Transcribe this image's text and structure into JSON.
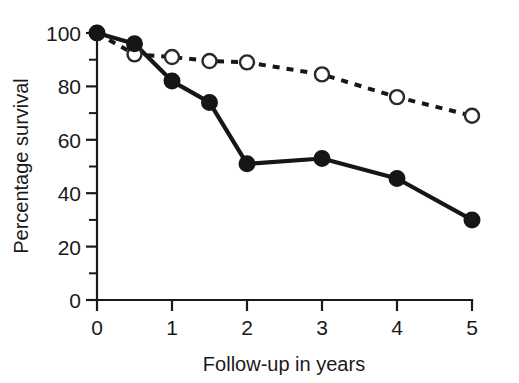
{
  "chart_data": {
    "type": "line",
    "title": "",
    "xlabel": "Follow-up in years",
    "ylabel": "Percentage survival",
    "xlim": [
      0,
      5
    ],
    "ylim": [
      0,
      100
    ],
    "xticks": [
      0,
      1,
      2,
      3,
      4,
      5
    ],
    "xtick_labels": [
      "0",
      "1",
      "2",
      "3",
      "4",
      "5"
    ],
    "yticks": [
      0,
      20,
      40,
      60,
      80,
      100
    ],
    "ytick_labels": [
      "0",
      "20",
      "40",
      "60",
      "80",
      "100"
    ],
    "yticks_minor": [
      10,
      30,
      50,
      70,
      90
    ],
    "grid": false,
    "legend": "none",
    "series": [
      {
        "name": "open-circle-dashed-series",
        "marker": "open-circle",
        "linestyle": "dashed",
        "x": [
          0,
          0.5,
          1,
          1.5,
          2,
          3,
          4,
          5
        ],
        "values": [
          100,
          92,
          91,
          89.5,
          89,
          84.5,
          76,
          69
        ]
      },
      {
        "name": "filled-circle-solid-series",
        "marker": "filled-circle",
        "linestyle": "solid",
        "x": [
          0,
          0.5,
          1,
          1.5,
          2,
          3,
          4,
          5
        ],
        "values": [
          100,
          96,
          82,
          74,
          51,
          53,
          45.5,
          30
        ]
      }
    ],
    "colors": {
      "axis": "#1a1a1a",
      "solid_line": "#161616",
      "dashed_line": "#161616",
      "marker_open_fill": "#ffffff",
      "background": "#ffffff"
    }
  }
}
